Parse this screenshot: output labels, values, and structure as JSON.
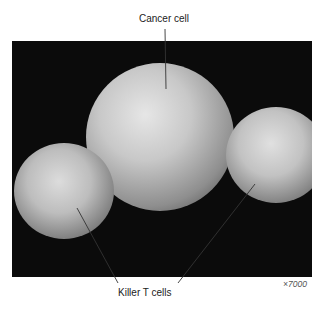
{
  "figure": {
    "labels": {
      "top": "Cancer cell",
      "bottom": "Killer T cells"
    },
    "magnification": "×7000",
    "colors": {
      "background": "#0b0b0b",
      "cell_light": "#d8d8d8",
      "cell_mid": "#9a9a9a",
      "leader_line": "#333333"
    }
  }
}
